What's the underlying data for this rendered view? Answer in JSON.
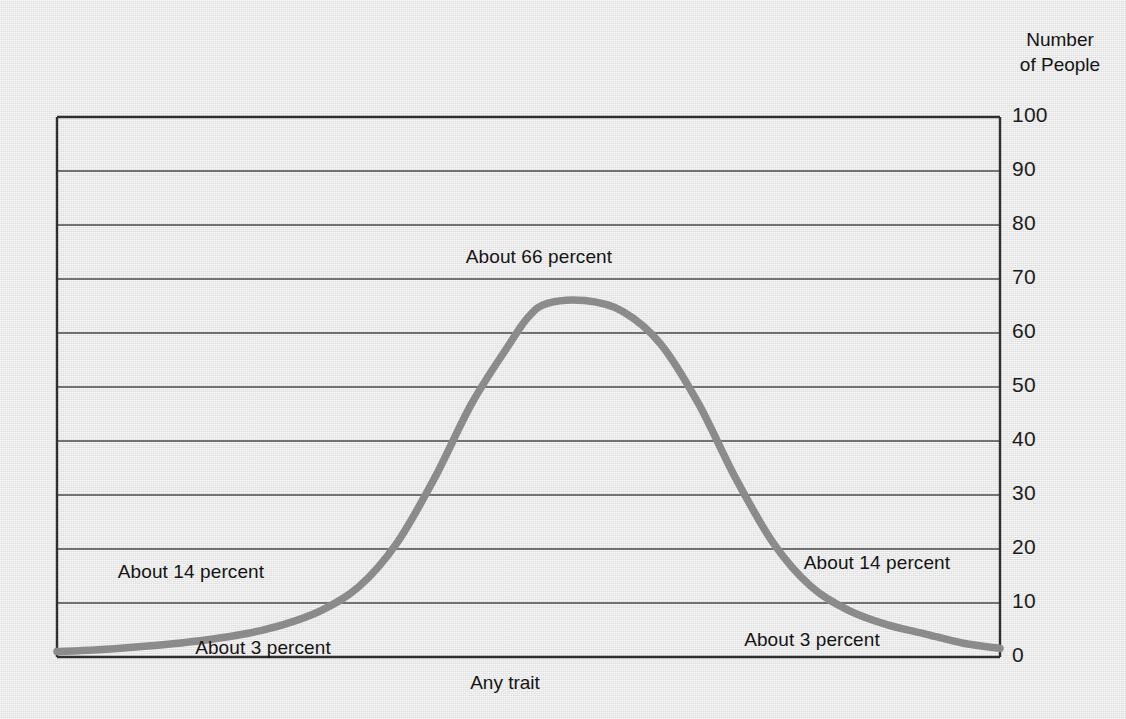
{
  "chart_data": {
    "type": "line",
    "title": "",
    "subtitle": "",
    "xlabel": "Any trait",
    "ylabel": "Number of People",
    "ylim": [
      0,
      100
    ],
    "y_ticks": [
      "0",
      "10",
      "20",
      "30",
      "40",
      "50",
      "60",
      "70",
      "80",
      "90",
      "100"
    ],
    "y_tick_values": [
      0,
      10,
      20,
      30,
      40,
      50,
      60,
      70,
      80,
      90,
      100
    ],
    "grid": true,
    "legend": "none",
    "x_tick_labels": [],
    "series": [
      {
        "name": "Normal distribution of any trait",
        "x": [
          0,
          4,
          8,
          12,
          16,
          20,
          24,
          28,
          32,
          36,
          40,
          44,
          48,
          50,
          52,
          56,
          60,
          64,
          68,
          72,
          76,
          80,
          84,
          88,
          92,
          96,
          100
        ],
        "values": [
          1,
          1.3,
          1.8,
          2.4,
          3.2,
          4.3,
          6,
          8.6,
          13,
          21,
          33,
          47,
          58,
          63,
          65.5,
          66,
          64,
          58,
          47,
          33,
          21,
          13,
          8.6,
          6,
          4.3,
          2.6,
          1.6
        ]
      }
    ],
    "annotations": [
      {
        "id": "peak",
        "text": "About 66 percent",
        "x_px": 539,
        "y_px": 257
      },
      {
        "id": "left-mid",
        "text": "About 14 percent",
        "x_px": 191,
        "y_px": 572
      },
      {
        "id": "right-mid",
        "text": "About 14 percent",
        "x_px": 877,
        "y_px": 563
      },
      {
        "id": "left-tail",
        "text": "About 3 percent",
        "x_px": 263,
        "y_px": 648
      },
      {
        "id": "right-tail",
        "text": "About 3 percent",
        "x_px": 812,
        "y_px": 640
      }
    ],
    "colors": {
      "curve": "#8b8b8b",
      "grid": "#4a4a4a",
      "axis": "#2e2e2e",
      "background": "#e9e9e9",
      "text": "#141414"
    }
  },
  "axis_titles": {
    "y_line1": "Number",
    "y_line2": "of People",
    "x": "Any trait"
  }
}
